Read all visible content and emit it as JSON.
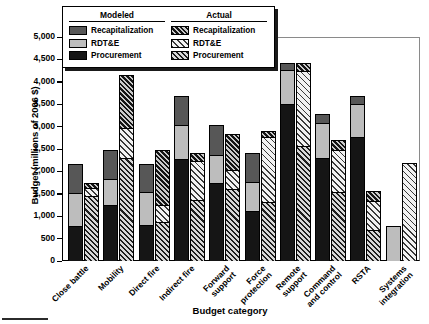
{
  "chart": {
    "type": "bar",
    "title": "",
    "xlabel": "Budget category",
    "ylabel": "Budget (millions of 2006 $)",
    "ylim": [
      0,
      5000
    ],
    "ytick_labels": [
      "5,000",
      "4,500",
      "4,000",
      "3,500",
      "3,000",
      "2,500",
      "2,000",
      "1,500",
      "1,000",
      "500",
      "0"
    ],
    "ytick_values": [
      5000,
      4500,
      4000,
      3500,
      3000,
      2500,
      2000,
      1500,
      1000,
      500,
      0
    ],
    "grid": false,
    "legend_position": "top-left",
    "stacked": true,
    "legend": {
      "groups": [
        {
          "name": "Modeled",
          "entries": [
            {
              "label": "Recapitalization",
              "swatch": "solid-dark-gray",
              "color": "#575757"
            },
            {
              "label": "RDT&E",
              "swatch": "solid-light-gray",
              "color": "#bdbdbd"
            },
            {
              "label": "Procurement",
              "swatch": "solid-black",
              "color": "#151515"
            }
          ]
        },
        {
          "name": "Actual",
          "entries": [
            {
              "label": "Recapitalization",
              "swatch": "hatch-dense",
              "color": "#141414"
            },
            {
              "label": "RDT&E",
              "swatch": "hatch-light",
              "color": "#f2f2f2"
            },
            {
              "label": "Procurement",
              "swatch": "hatch-dark",
              "color": "#1d1d1d"
            }
          ]
        }
      ]
    }
  },
  "chart_data": {
    "type": "bar",
    "title": "",
    "xlabel": "Budget category",
    "ylabel": "Budget (millions of 2006 $)",
    "ylim": [
      0,
      5000
    ],
    "grid": false,
    "stacked": true,
    "legend_position": "top-left",
    "categories": [
      "Close battle",
      "Mobility",
      "Direct fire",
      "Indirect fire",
      "Forward support",
      "Force protection",
      "Remote support",
      "Command and control",
      "RSTA",
      "Systems integration"
    ],
    "category_label_lines": [
      [
        "Close battle"
      ],
      [
        "Mobility"
      ],
      [
        "Direct fire"
      ],
      [
        "Indirect fire"
      ],
      [
        "Forward",
        "support"
      ],
      [
        "Force",
        "protection"
      ],
      [
        "Remote",
        "support"
      ],
      [
        "Command",
        "and control"
      ],
      [
        "RSTA"
      ],
      [
        "Systems",
        "integration"
      ]
    ],
    "series": [
      {
        "name": "Modeled Procurement",
        "group": "Modeled",
        "component": "Procurement",
        "values": [
          790,
          1260,
          800,
          2270,
          1730,
          1120,
          3510,
          2290,
          2770,
          0
        ]
      },
      {
        "name": "Modeled RDT&E",
        "group": "Modeled",
        "component": "RDT&E",
        "values": [
          720,
          570,
          740,
          770,
          630,
          640,
          760,
          800,
          740,
          750
        ]
      },
      {
        "name": "Modeled Recapitalization",
        "group": "Modeled",
        "component": "Recapitalization",
        "values": [
          630,
          630,
          610,
          610,
          650,
          630,
          120,
          180,
          150,
          0
        ]
      },
      {
        "name": "Actual Procurement",
        "group": "Actual",
        "component": "Procurement",
        "values": [
          1450,
          2290,
          860,
          1370,
          1610,
          1320,
          2570,
          1540,
          690,
          0
        ]
      },
      {
        "name": "Actual RDT&E",
        "group": "Actual",
        "component": "RDT&E",
        "values": [
          170,
          670,
          400,
          860,
          420,
          1450,
          1680,
          930,
          650,
          2160
        ]
      },
      {
        "name": "Actual Recapitalization",
        "group": "Actual",
        "component": "Recapitalization",
        "values": [
          90,
          1180,
          1190,
          160,
          780,
          100,
          140,
          200,
          210,
          0
        ]
      }
    ],
    "totals": {
      "modeled": [
        2140,
        2460,
        2150,
        3650,
        3010,
        2390,
        4390,
        3270,
        3660,
        750
      ],
      "actual": [
        1710,
        4140,
        2450,
        2390,
        2810,
        2870,
        4390,
        2670,
        1550,
        2160
      ]
    }
  }
}
